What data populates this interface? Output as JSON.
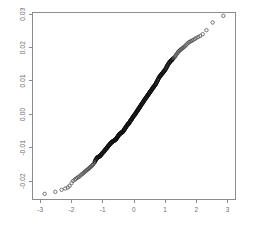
{
  "chart_data": {
    "type": "scatter",
    "title": "",
    "subtitle": "",
    "xlabel": "",
    "ylabel": "",
    "xlim": [
      -3.25,
      3.25
    ],
    "ylim": [
      -0.0255,
      0.0305
    ],
    "grid": false,
    "legend": null,
    "xticks": [
      -3,
      -2,
      -1,
      0,
      1,
      2,
      3
    ],
    "xtick_labels": [
      "-3",
      "-2",
      "-1",
      "0",
      "1",
      "2",
      "3"
    ],
    "yticks": [
      -0.02,
      -0.01,
      0.0,
      0.01,
      0.02,
      0.03
    ],
    "ytick_labels": [
      "-0.02",
      "-0.01",
      "0.00",
      "0.01",
      "0.02",
      "0.03"
    ],
    "marker": "open-circle",
    "marker_color": "#333333",
    "frame_color": "#8c8c8c",
    "tick_label_color": "#6e6e6e",
    "ytick_label_rotation": -90,
    "series": [
      {
        "name": "sample-quantiles",
        "x": [
          -2.86,
          -2.52,
          -2.32,
          -2.2,
          -2.12,
          -2.06,
          -2.0,
          -1.95,
          -1.9,
          -1.86,
          -1.82,
          -1.78,
          -1.75,
          -1.71,
          -1.68,
          -1.65,
          -1.62,
          -1.59,
          -1.56,
          -1.54,
          -1.51,
          -1.48,
          -1.46,
          -1.43,
          -1.41,
          -1.39,
          -1.36,
          -1.34,
          -1.32,
          -1.3,
          -1.27,
          -1.25,
          -1.23,
          -1.21,
          -1.19,
          -1.17,
          -1.15,
          -1.13,
          -1.11,
          -1.09,
          -1.07,
          -1.05,
          -1.04,
          -1.02,
          -1.0,
          -0.98,
          -0.96,
          -0.94,
          -0.93,
          -0.91,
          -0.89,
          -0.87,
          -0.86,
          -0.84,
          -0.82,
          -0.81,
          -0.79,
          -0.77,
          -0.76,
          -0.74,
          -0.72,
          -0.71,
          -0.69,
          -0.68,
          -0.66,
          -0.64,
          -0.63,
          -0.61,
          -0.6,
          -0.58,
          -0.57,
          -0.55,
          -0.54,
          -0.52,
          -0.51,
          -0.49,
          -0.48,
          -0.46,
          -0.45,
          -0.43,
          -0.42,
          -0.4,
          -0.39,
          -0.37,
          -0.36,
          -0.34,
          -0.33,
          -0.31,
          -0.3,
          -0.29,
          -0.27,
          -0.26,
          -0.24,
          -0.23,
          -0.21,
          -0.2,
          -0.19,
          -0.17,
          -0.16,
          -0.14,
          -0.13,
          -0.12,
          -0.1,
          -0.09,
          -0.07,
          -0.06,
          -0.05,
          -0.03,
          -0.02,
          0.0,
          0.02,
          0.03,
          0.05,
          0.06,
          0.07,
          0.09,
          0.1,
          0.12,
          0.13,
          0.14,
          0.16,
          0.17,
          0.19,
          0.2,
          0.21,
          0.23,
          0.24,
          0.26,
          0.27,
          0.29,
          0.3,
          0.31,
          0.33,
          0.34,
          0.36,
          0.37,
          0.39,
          0.4,
          0.42,
          0.43,
          0.45,
          0.46,
          0.48,
          0.49,
          0.51,
          0.52,
          0.54,
          0.55,
          0.57,
          0.58,
          0.6,
          0.61,
          0.63,
          0.64,
          0.66,
          0.68,
          0.69,
          0.71,
          0.72,
          0.74,
          0.76,
          0.77,
          0.79,
          0.81,
          0.82,
          0.84,
          0.86,
          0.87,
          0.89,
          0.91,
          0.93,
          0.94,
          0.96,
          0.98,
          1.0,
          1.02,
          1.04,
          1.05,
          1.07,
          1.09,
          1.11,
          1.13,
          1.15,
          1.17,
          1.19,
          1.21,
          1.23,
          1.25,
          1.27,
          1.3,
          1.32,
          1.34,
          1.36,
          1.39,
          1.41,
          1.43,
          1.46,
          1.48,
          1.51,
          1.54,
          1.56,
          1.59,
          1.62,
          1.65,
          1.68,
          1.71,
          1.75,
          1.78,
          1.82,
          1.86,
          1.9,
          1.95,
          2.0,
          2.06,
          2.12,
          2.2,
          2.32,
          2.52,
          2.86
        ],
        "y": [
          -0.0238,
          -0.0232,
          -0.0226,
          -0.0222,
          -0.0219,
          -0.0214,
          -0.0206,
          -0.0199,
          -0.0196,
          -0.0193,
          -0.019,
          -0.0188,
          -0.0186,
          -0.0183,
          -0.018,
          -0.0178,
          -0.0176,
          -0.0173,
          -0.0171,
          -0.0169,
          -0.0167,
          -0.0165,
          -0.0163,
          -0.0161,
          -0.0159,
          -0.0157,
          -0.0155,
          -0.0153,
          -0.0151,
          -0.0149,
          -0.0145,
          -0.0141,
          -0.0137,
          -0.0134,
          -0.0131,
          -0.0129,
          -0.0128,
          -0.0127,
          -0.0126,
          -0.0125,
          -0.0123,
          -0.0121,
          -0.0119,
          -0.0117,
          -0.0115,
          -0.0113,
          -0.0111,
          -0.0109,
          -0.0107,
          -0.0105,
          -0.0103,
          -0.0101,
          -0.0099,
          -0.0097,
          -0.0095,
          -0.0093,
          -0.0091,
          -0.0089,
          -0.0088,
          -0.0086,
          -0.0084,
          -0.0083,
          -0.0082,
          -0.0081,
          -0.008,
          -0.0079,
          -0.0078,
          -0.0077,
          -0.0076,
          -0.0075,
          -0.0073,
          -0.0071,
          -0.0069,
          -0.0067,
          -0.0065,
          -0.0063,
          -0.0061,
          -0.0059,
          -0.0058,
          -0.0057,
          -0.0056,
          -0.0055,
          -0.0054,
          -0.0053,
          -0.0052,
          -0.005,
          -0.0048,
          -0.0046,
          -0.0044,
          -0.0042,
          -0.004,
          -0.0038,
          -0.0036,
          -0.0034,
          -0.0032,
          -0.003,
          -0.0029,
          -0.0028,
          -0.0026,
          -0.0024,
          -0.0022,
          -0.002,
          -0.0018,
          -0.0016,
          -0.0014,
          -0.0012,
          -0.001,
          -0.0008,
          -0.0006,
          -0.0004,
          -0.0002,
          0.0,
          0.0002,
          0.0004,
          0.0006,
          0.0008,
          0.001,
          0.0012,
          0.0014,
          0.0016,
          0.0018,
          0.002,
          0.0022,
          0.0024,
          0.0026,
          0.0028,
          0.003,
          0.0032,
          0.0034,
          0.0036,
          0.0038,
          0.004,
          0.0042,
          0.0044,
          0.0046,
          0.0048,
          0.005,
          0.0052,
          0.0054,
          0.0056,
          0.0058,
          0.006,
          0.0062,
          0.0064,
          0.0066,
          0.0068,
          0.007,
          0.0072,
          0.0074,
          0.0076,
          0.0078,
          0.008,
          0.0082,
          0.0084,
          0.0086,
          0.0088,
          0.009,
          0.0093,
          0.0096,
          0.0099,
          0.0102,
          0.0105,
          0.0108,
          0.0111,
          0.0113,
          0.0115,
          0.0117,
          0.0119,
          0.0121,
          0.0123,
          0.0125,
          0.0127,
          0.0129,
          0.0131,
          0.0134,
          0.0137,
          0.014,
          0.0143,
          0.0146,
          0.0149,
          0.0152,
          0.0155,
          0.0157,
          0.0159,
          0.0161,
          0.0163,
          0.0165,
          0.0167,
          0.0169,
          0.0171,
          0.0174,
          0.0177,
          0.018,
          0.0183,
          0.0186,
          0.0189,
          0.0191,
          0.0193,
          0.0195,
          0.0197,
          0.0199,
          0.0201,
          0.0203,
          0.0206,
          0.0209,
          0.0212,
          0.0215,
          0.0217,
          0.0219,
          0.0221,
          0.0223,
          0.0226,
          0.0229,
          0.0232,
          0.0235,
          0.024,
          0.0252,
          0.0275,
          0.0295
        ]
      }
    ]
  }
}
